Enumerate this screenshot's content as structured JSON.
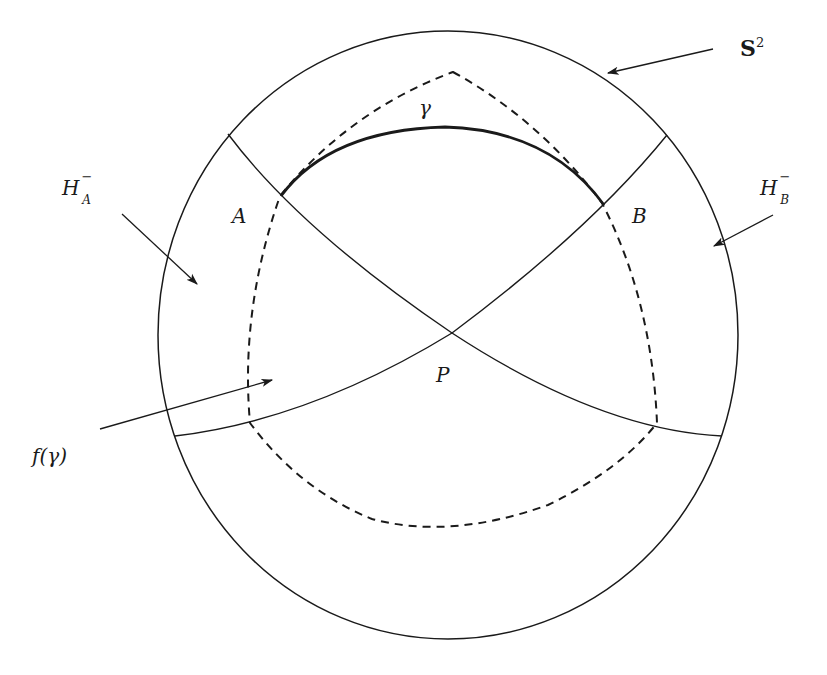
{
  "figure": {
    "type": "geometric diagram on the sphere",
    "labels": {
      "sphere": "S",
      "sphere_exp": "2",
      "half_space_A_base": "H",
      "half_space_A_sup": "−",
      "half_space_A_sub": "A",
      "half_space_B_base": "H",
      "half_space_B_sup": "−",
      "half_space_B_sub": "B",
      "point_A": "A",
      "point_B": "B",
      "point_P": "P",
      "curve_gamma": "γ",
      "image_curve": "f(γ)"
    },
    "colors": {
      "stroke": "#1a1a1a",
      "background": "#ffffff"
    }
  }
}
